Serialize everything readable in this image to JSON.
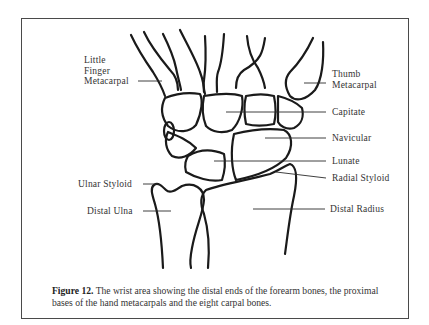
{
  "figure": {
    "labels": {
      "little_finger_metacarpal": [
        "Little",
        "Finger",
        "Metacarpal"
      ],
      "thumb_metacarpal": [
        "Thumb",
        "Metacarpal"
      ],
      "capitate": "Capitate",
      "navicular": "Navicular",
      "lunate": "Lunate",
      "radial_styloid": "Radial Styloid",
      "ulnar_styloid": "Ulnar Styloid",
      "distal_ulna": "Distal Ulna",
      "distal_radius": "Distal Radius"
    },
    "caption": {
      "number": "Figure 12.",
      "text": " The wrist area showing the distal ends of the forearm bones, the proximal bases of the hand metacarpals and the eight carpal bones."
    },
    "colors": {
      "line": "#1a1a1a",
      "text": "#333333",
      "frame": "#4a4a4a",
      "background": "#ffffff"
    }
  }
}
